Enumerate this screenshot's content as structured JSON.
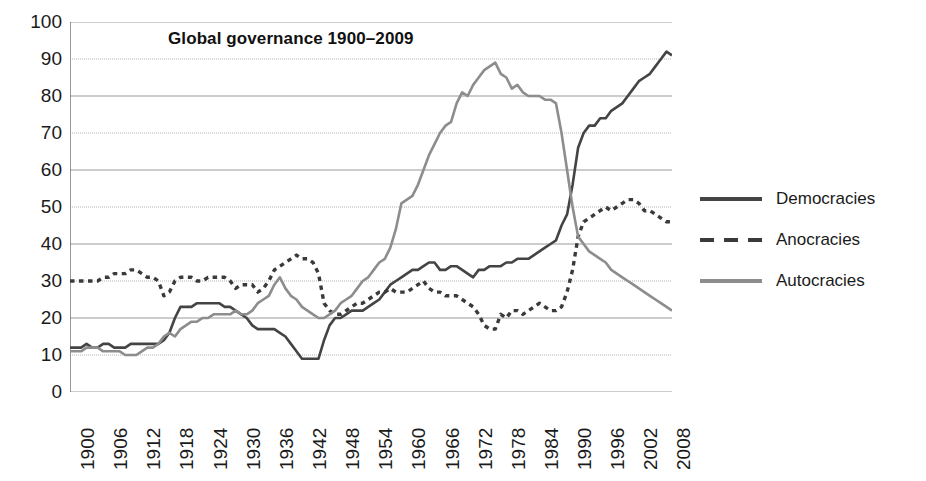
{
  "chart_data": {
    "type": "line",
    "title": "Global governance 1900–2009",
    "xlabel": "",
    "ylabel": "",
    "xlim": [
      1900,
      2009
    ],
    "ylim": [
      0,
      100
    ],
    "ytick_step": 10,
    "yticks": [
      0,
      10,
      20,
      30,
      40,
      50,
      60,
      70,
      80,
      90,
      100
    ],
    "xticks": [
      1900,
      1906,
      1912,
      1918,
      1924,
      1930,
      1936,
      1942,
      1948,
      1954,
      1960,
      1966,
      1972,
      1978,
      1984,
      1990,
      1996,
      2002,
      2008
    ],
    "xtick_step": 6,
    "grid": true,
    "grid_axis": "y",
    "legend_position": "right",
    "x": [
      1900,
      1901,
      1902,
      1903,
      1904,
      1905,
      1906,
      1907,
      1908,
      1909,
      1910,
      1911,
      1912,
      1913,
      1914,
      1915,
      1916,
      1917,
      1918,
      1919,
      1920,
      1921,
      1922,
      1923,
      1924,
      1925,
      1926,
      1927,
      1928,
      1929,
      1930,
      1931,
      1932,
      1933,
      1934,
      1935,
      1936,
      1937,
      1938,
      1939,
      1940,
      1941,
      1942,
      1943,
      1944,
      1945,
      1946,
      1947,
      1948,
      1949,
      1950,
      1951,
      1952,
      1953,
      1954,
      1955,
      1956,
      1957,
      1958,
      1959,
      1960,
      1961,
      1962,
      1963,
      1964,
      1965,
      1966,
      1967,
      1968,
      1969,
      1970,
      1971,
      1972,
      1973,
      1974,
      1975,
      1976,
      1977,
      1978,
      1979,
      1980,
      1981,
      1982,
      1983,
      1984,
      1985,
      1986,
      1987,
      1988,
      1989,
      1990,
      1991,
      1992,
      1993,
      1994,
      1995,
      1996,
      1997,
      1998,
      1999,
      2000,
      2001,
      2002,
      2003,
      2004,
      2005,
      2006,
      2007,
      2008,
      2009
    ],
    "series": [
      {
        "name": "Democracies",
        "style": "solid",
        "color": "#444444",
        "values": [
          12,
          12,
          12,
          13,
          12,
          12,
          13,
          13,
          12,
          12,
          12,
          13,
          13,
          13,
          13,
          13,
          13,
          14,
          16,
          20,
          23,
          23,
          23,
          24,
          24,
          24,
          24,
          24,
          23,
          23,
          22,
          21,
          20,
          18,
          17,
          17,
          17,
          17,
          16,
          15,
          13,
          11,
          9,
          9,
          9,
          9,
          14,
          18,
          20,
          20,
          21,
          22,
          22,
          22,
          23,
          24,
          25,
          27,
          29,
          30,
          31,
          32,
          33,
          33,
          34,
          35,
          35,
          33,
          33,
          34,
          34,
          33,
          32,
          31,
          33,
          33,
          34,
          34,
          34,
          35,
          35,
          36,
          36,
          36,
          37,
          38,
          39,
          40,
          41,
          45,
          48,
          56,
          66,
          70,
          72,
          72,
          74,
          74,
          76,
          77,
          78,
          80,
          82,
          84,
          85,
          86,
          88,
          90,
          92,
          91
        ]
      },
      {
        "name": "Anocracies",
        "style": "dashed",
        "color": "#3a3a3a",
        "values": [
          30,
          30,
          30,
          30,
          30,
          30,
          31,
          31,
          32,
          32,
          32,
          33,
          33,
          32,
          31,
          31,
          30,
          26,
          27,
          30,
          31,
          31,
          31,
          30,
          30,
          31,
          31,
          31,
          31,
          30,
          28,
          29,
          29,
          29,
          27,
          28,
          30,
          33,
          34,
          35,
          36,
          37,
          36,
          36,
          35,
          32,
          24,
          22,
          21,
          21,
          22,
          23,
          24,
          24,
          25,
          26,
          27,
          27,
          28,
          27,
          27,
          27,
          28,
          29,
          30,
          28,
          27,
          27,
          26,
          26,
          26,
          25,
          24,
          23,
          21,
          18,
          17,
          17,
          21,
          20,
          22,
          22,
          21,
          22,
          23,
          24,
          23,
          22,
          22,
          23,
          27,
          33,
          42,
          46,
          47,
          48,
          49,
          50,
          49,
          50,
          51,
          52,
          52,
          51,
          49,
          49,
          48,
          47,
          46,
          46
        ]
      },
      {
        "name": "Autocracies",
        "style": "solid",
        "color": "#8d8d8d",
        "values": [
          11,
          11,
          11,
          12,
          12,
          12,
          11,
          11,
          11,
          11,
          10,
          10,
          10,
          11,
          12,
          12,
          13,
          15,
          16,
          15,
          17,
          18,
          19,
          19,
          20,
          20,
          21,
          21,
          21,
          21,
          22,
          21,
          21,
          22,
          24,
          25,
          26,
          29,
          31,
          28,
          26,
          25,
          23,
          22,
          21,
          20,
          20,
          21,
          22,
          24,
          25,
          26,
          28,
          30,
          31,
          33,
          35,
          36,
          39,
          44,
          51,
          52,
          53,
          56,
          60,
          64,
          67,
          70,
          72,
          73,
          78,
          81,
          80,
          83,
          85,
          87,
          88,
          89,
          86,
          85,
          82,
          83,
          81,
          80,
          80,
          80,
          79,
          79,
          78,
          70,
          60,
          50,
          42,
          40,
          38,
          37,
          36,
          35,
          33,
          32,
          31,
          30,
          29,
          28,
          27,
          26,
          25,
          24,
          23,
          22
        ]
      }
    ]
  },
  "legend": {
    "items": [
      {
        "label": "Democracies",
        "style": "solid",
        "color": "#444444"
      },
      {
        "label": "Anocracies",
        "style": "dashed",
        "color": "#3a3a3a"
      },
      {
        "label": "Autocracies",
        "style": "solid",
        "color": "#8d8d8d"
      }
    ]
  },
  "axis": {
    "y_labels": [
      "100",
      "90",
      "80",
      "70",
      "60",
      "50",
      "40",
      "30",
      "20",
      "10",
      "0"
    ],
    "x_labels": [
      "1900",
      "1906",
      "1912",
      "1918",
      "1924",
      "1930",
      "1936",
      "1942",
      "1948",
      "1954",
      "1960",
      "1966",
      "1972",
      "1978",
      "1984",
      "1990",
      "1996",
      "2002",
      "2008"
    ]
  },
  "colors": {
    "axis": "#6f6f6f",
    "grid": "#9a9a9a",
    "text": "#1a1a1a",
    "background": "#ffffff"
  }
}
